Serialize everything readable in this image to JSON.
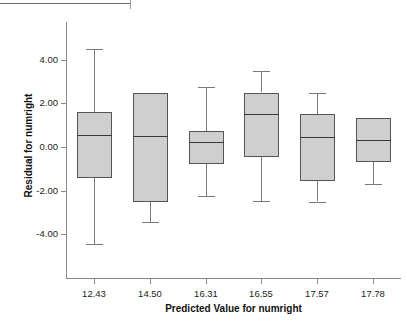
{
  "chart_data": {
    "type": "box",
    "title": "",
    "xlabel": "Predicted Value for numright",
    "ylabel": "Residual for numright",
    "categories": [
      "12.43",
      "14.50",
      "16.31",
      "16.55",
      "17.57",
      "17.78"
    ],
    "y_ticks": [
      "4.00",
      "2.00",
      "0.00",
      "-2.00",
      "-4.00"
    ],
    "y_tick_values": [
      4.0,
      2.0,
      0.0,
      -2.0,
      -4.0
    ],
    "ylim": [
      -5.6,
      5.1
    ],
    "grid": false,
    "legend": null,
    "box_fill_color": "#cfcfcf",
    "box_border_color": "#555555",
    "axis_color": "#8a8a8a",
    "boxes": [
      {
        "category": "12.43",
        "lower_whisker": -4.45,
        "q1": -1.4,
        "median": 0.55,
        "q3": 1.6,
        "upper_whisker": 4.5,
        "has_upper_whisker": true,
        "has_lower_whisker": true
      },
      {
        "category": "14.50",
        "lower_whisker": -3.45,
        "q1": -2.5,
        "median": 0.5,
        "q3": 2.5,
        "upper_whisker": 2.5,
        "has_upper_whisker": false,
        "has_lower_whisker": true
      },
      {
        "category": "16.31",
        "lower_whisker": -2.25,
        "q1": -0.78,
        "median": 0.23,
        "q3": 0.72,
        "upper_whisker": 2.75,
        "has_upper_whisker": true,
        "has_lower_whisker": true
      },
      {
        "category": "16.55",
        "lower_whisker": -2.48,
        "q1": -0.48,
        "median": 1.5,
        "q3": 2.5,
        "upper_whisker": 3.5,
        "has_upper_whisker": true,
        "has_lower_whisker": true
      },
      {
        "category": "17.57",
        "lower_whisker": -2.5,
        "q1": -1.55,
        "median": 0.48,
        "q3": 1.5,
        "upper_whisker": 2.5,
        "has_upper_whisker": true,
        "has_lower_whisker": true
      },
      {
        "category": "17.78",
        "lower_whisker": -1.72,
        "q1": -0.68,
        "median": 0.32,
        "q3": 1.32,
        "upper_whisker": 1.32,
        "has_upper_whisker": false,
        "has_lower_whisker": true
      }
    ]
  }
}
